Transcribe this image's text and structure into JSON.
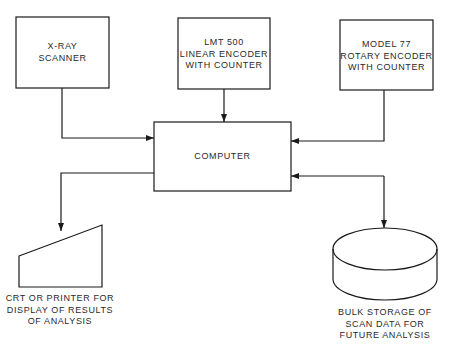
{
  "diagram": {
    "nodes": {
      "xray": {
        "lines": [
          "X-RAY",
          "SCANNER"
        ]
      },
      "lmt": {
        "lines": [
          "LMT 500",
          "LINEAR ENCODER",
          "WITH COUNTER"
        ]
      },
      "model77": {
        "lines": [
          "MODEL 77",
          "ROTARY ENCODER",
          "WITH COUNTER"
        ]
      },
      "computer": {
        "lines": [
          "COMPUTER"
        ]
      },
      "display": {
        "lines": [
          "CRT OR PRINTER FOR",
          "DISPLAY OF RESULTS",
          "OF ANALYSIS"
        ]
      },
      "storage": {
        "lines": [
          "BULK STORAGE OF",
          "SCAN DATA FOR",
          "FUTURE ANALYSIS"
        ]
      }
    },
    "edges": [
      {
        "from": "X-RAY SCANNER",
        "to": "COMPUTER"
      },
      {
        "from": "LMT 500 LINEAR ENCODER WITH COUNTER",
        "to": "COMPUTER"
      },
      {
        "from": "MODEL 77 ROTARY ENCODER WITH COUNTER",
        "to": "COMPUTER"
      },
      {
        "from": "COMPUTER",
        "to": "CRT OR PRINTER FOR DISPLAY OF RESULTS OF ANALYSIS"
      },
      {
        "from": "COMPUTER",
        "to": "BULK STORAGE OF SCAN DATA FOR FUTURE ANALYSIS",
        "bidirectional": true
      }
    ],
    "colors": {
      "stroke": "#1a1a1a",
      "text": "#2a2a2a",
      "background": "#ffffff"
    }
  }
}
